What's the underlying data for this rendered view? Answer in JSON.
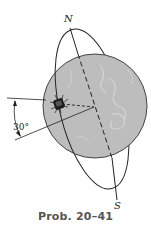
{
  "figure": {
    "caption": "Prob. 20–41",
    "labels": {
      "north": "N",
      "south": "S",
      "angle": "30°"
    },
    "colors": {
      "globe_fill": "#bdbdbd",
      "globe_edge": "#444444",
      "line": "#222222",
      "caption": "#555555"
    },
    "icons": [
      "satellite-icon",
      "planet-globe",
      "orbit-ellipse",
      "rotation-axis"
    ]
  }
}
